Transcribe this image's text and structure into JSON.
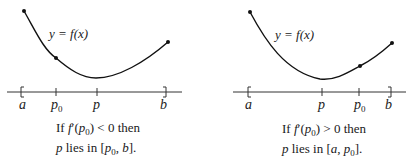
{
  "panels": [
    {
      "curve_label": "y = f(x)",
      "axis_labels": {
        "a": "a",
        "p0": "p",
        "p0_sub": "0",
        "p": "p",
        "b": "b"
      },
      "caption": {
        "line1_pre": "If ",
        "line1_f": "f",
        "line1_prime": "′(",
        "line1_p": "p",
        "line1_sub": "0",
        "line1_post": ") < 0 then",
        "line2_p": "p",
        "line2_mid": " lies in [",
        "line2_p0": "p",
        "line2_sub": "0",
        "line2_end": ", ",
        "line2_b": "b",
        "line2_close": "]."
      }
    },
    {
      "curve_label": "y = f(x)",
      "axis_labels": {
        "a": "a",
        "p": "p",
        "p0": "p",
        "p0_sub": "0",
        "b": "b"
      },
      "caption": {
        "line1_pre": "If ",
        "line1_f": "f",
        "line1_prime": "′(",
        "line1_p": "p",
        "line1_sub": "0",
        "line1_post": ") > 0 then",
        "line2_p": "p",
        "line2_mid": " lies in [",
        "line2_a": "a",
        "line2_end": ", ",
        "line2_p0": "p",
        "line2_sub": "0",
        "line2_close": "]."
      }
    }
  ]
}
